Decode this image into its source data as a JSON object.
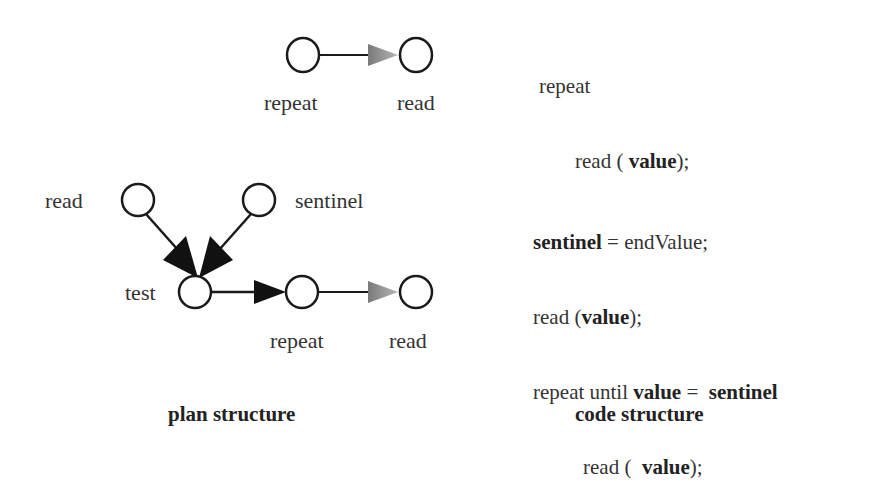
{
  "top_plan": {
    "nodes": [
      {
        "id": "repeat",
        "label": "repeat",
        "cx": 303,
        "cy": 55
      },
      {
        "id": "read",
        "label": "read",
        "cx": 416,
        "cy": 55
      }
    ],
    "edges": [
      {
        "from": "repeat",
        "to": "read",
        "style": "shaded-arrow"
      }
    ]
  },
  "top_code": {
    "lines": [
      {
        "indent": 0,
        "parts": [
          {
            "text": "repeat",
            "bold": false
          }
        ]
      },
      {
        "indent": 1,
        "parts": [
          {
            "text": "read ( ",
            "bold": false
          },
          {
            "text": "value",
            "bold": true
          },
          {
            "text": ");",
            "bold": false
          }
        ]
      }
    ]
  },
  "bottom_plan": {
    "nodes": [
      {
        "id": "read",
        "label": "read",
        "cx": 138,
        "cy": 200
      },
      {
        "id": "sentinel",
        "label": "sentinel",
        "cx": 259,
        "cy": 200
      },
      {
        "id": "test",
        "label": "test",
        "cx": 195,
        "cy": 292
      },
      {
        "id": "repeat",
        "label": "repeat",
        "cx": 302,
        "cy": 292
      },
      {
        "id": "read2",
        "label": "read",
        "cx": 416,
        "cy": 292
      }
    ],
    "edges": [
      {
        "from": "read",
        "to": "test",
        "style": "solid-arrow"
      },
      {
        "from": "sentinel",
        "to": "test",
        "style": "solid-arrow"
      },
      {
        "from": "test",
        "to": "repeat",
        "style": "solid-arrow"
      },
      {
        "from": "repeat",
        "to": "read2",
        "style": "shaded-arrow"
      }
    ]
  },
  "bottom_code": {
    "lines": [
      {
        "indent": 0,
        "parts": [
          {
            "text": "sentinel",
            "bold": true
          },
          {
            "text": " = endValue;",
            "bold": false
          }
        ]
      },
      {
        "indent": 0,
        "parts": [
          {
            "text": "read (",
            "bold": false
          },
          {
            "text": "value",
            "bold": true
          },
          {
            "text": ");",
            "bold": false
          }
        ]
      },
      {
        "indent": 0,
        "parts": [
          {
            "text": "repeat until ",
            "bold": false
          },
          {
            "text": "value",
            "bold": true
          },
          {
            "text": " =  ",
            "bold": false
          },
          {
            "text": "sentinel",
            "bold": true
          }
        ]
      },
      {
        "indent": 1,
        "parts": [
          {
            "text": "read (  ",
            "bold": false
          },
          {
            "text": "value",
            "bold": true
          },
          {
            "text": ");",
            "bold": false
          }
        ]
      }
    ]
  },
  "captions": {
    "plan": "plan structure",
    "code": "code structure"
  },
  "labels": {
    "top_repeat": "repeat",
    "top_read": "read",
    "b_read": "read",
    "b_sentinel": "sentinel",
    "b_test": "test",
    "b_repeat": "repeat",
    "b_read2": "read"
  },
  "colors": {
    "stroke": "#1a1a1a",
    "shaded_arrow": "#8a8a8a",
    "background": "#ffffff"
  }
}
